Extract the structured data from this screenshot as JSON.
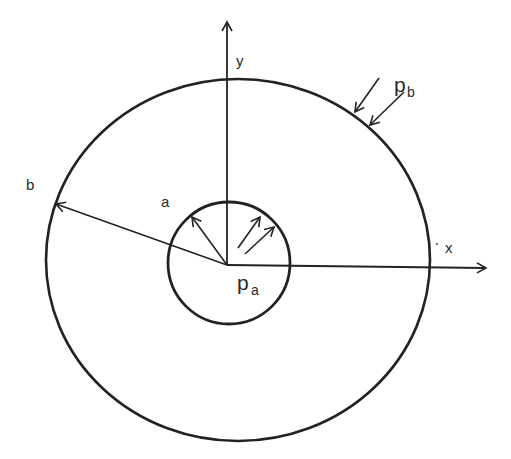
{
  "diagram": {
    "type": "thick-walled-cylinder-cross-section",
    "labels": {
      "y_axis": "y",
      "x_axis": "x",
      "inner_radius": "a",
      "outer_radius": "b",
      "inner_pressure_main": "p",
      "inner_pressure_sub": "a",
      "outer_pressure_main": "p",
      "outer_pressure_sub": "b"
    },
    "colors": {
      "stroke": "#222222",
      "background": "#ffffff"
    }
  }
}
